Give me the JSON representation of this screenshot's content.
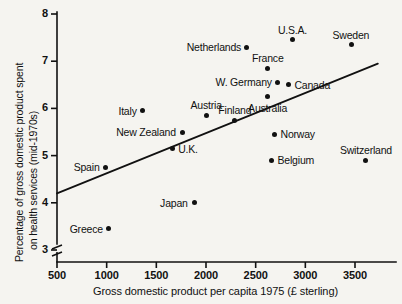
{
  "chart_data": {
    "type": "scatter",
    "title": "",
    "xlabel": "Gross domestic product per capita 1975 (£ sterling)",
    "ylabel": "Percentage of gross domestic product spent on health services (mid-1970s)",
    "xlim": [
      500,
      3600
    ],
    "ylim": [
      3,
      8
    ],
    "y_axis_break": true,
    "grid": false,
    "legend": null,
    "xticks": [
      {
        "value": 500,
        "label": "500"
      },
      {
        "value": 1000,
        "label": "1000"
      },
      {
        "value": 1500,
        "label": "1500"
      },
      {
        "value": 2000,
        "label": "2000"
      },
      {
        "value": 2500,
        "label": "2500"
      },
      {
        "value": 3000,
        "label": "3000"
      },
      {
        "value": 3500,
        "label": "3500"
      }
    ],
    "yticks": [
      {
        "value": 8,
        "label": "8"
      },
      {
        "value": 7,
        "label": "7"
      },
      {
        "value": 6,
        "label": "6"
      },
      {
        "value": 5,
        "label": "5"
      },
      {
        "value": 4,
        "label": "4"
      },
      {
        "value": 3,
        "label": "3"
      }
    ],
    "points": [
      {
        "name": "U.S.A.",
        "x": 2870,
        "y": 7.45,
        "label_pos": "above"
      },
      {
        "name": "Sweden",
        "x": 3460,
        "y": 7.35,
        "label_pos": "above"
      },
      {
        "name": "Netherlands",
        "x": 2410,
        "y": 7.3,
        "label_pos": "left"
      },
      {
        "name": "France",
        "x": 2620,
        "y": 6.85,
        "label_pos": "above"
      },
      {
        "name": "W. Germany",
        "x": 2720,
        "y": 6.55,
        "label_pos": "left"
      },
      {
        "name": "Canada",
        "x": 2830,
        "y": 6.5,
        "label_pos": "right"
      },
      {
        "name": "Australia",
        "x": 2620,
        "y": 6.25,
        "label_pos": "below"
      },
      {
        "name": "Italy",
        "x": 1360,
        "y": 5.95,
        "label_pos": "left"
      },
      {
        "name": "Austria",
        "x": 2000,
        "y": 5.85,
        "label_pos": "above"
      },
      {
        "name": "Finland",
        "x": 2290,
        "y": 5.75,
        "label_pos": "above"
      },
      {
        "name": "New Zealand",
        "x": 1760,
        "y": 5.5,
        "label_pos": "left"
      },
      {
        "name": "Norway",
        "x": 2690,
        "y": 5.45,
        "label_pos": "right"
      },
      {
        "name": "U.K.",
        "x": 1660,
        "y": 5.15,
        "label_pos": "right"
      },
      {
        "name": "Belgium",
        "x": 2660,
        "y": 4.9,
        "label_pos": "right"
      },
      {
        "name": "Switzerland",
        "x": 3610,
        "y": 4.9,
        "label_pos": "above"
      },
      {
        "name": "Spain",
        "x": 990,
        "y": 4.75,
        "label_pos": "left"
      },
      {
        "name": "Japan",
        "x": 1880,
        "y": 4.0,
        "label_pos": "left"
      },
      {
        "name": "Greece",
        "x": 1020,
        "y": 3.45,
        "label_pos": "left"
      }
    ],
    "trend_line": {
      "x_start": 500,
      "y_start": 4.2,
      "x_end": 3730,
      "y_end": 6.95
    }
  }
}
